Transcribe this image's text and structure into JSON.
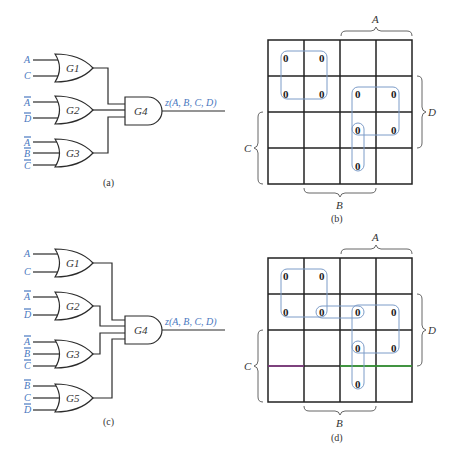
{
  "figure": {
    "panels": [
      {
        "id": "a",
        "caption": "(a)",
        "type": "logic-circuit",
        "gates": [
          {
            "name": "G1",
            "type": "OR",
            "inputs": [
              "A",
              "C"
            ],
            "input_bars": [
              false,
              false
            ]
          },
          {
            "name": "G2",
            "type": "OR",
            "inputs": [
              "A",
              "D"
            ],
            "input_bars": [
              true,
              true
            ]
          },
          {
            "name": "G3",
            "type": "OR",
            "inputs": [
              "A",
              "B",
              "C"
            ],
            "input_bars": [
              true,
              true,
              true
            ]
          },
          {
            "name": "G4",
            "type": "AND",
            "inputs": [
              "G1",
              "G2",
              "G3"
            ]
          }
        ],
        "output_label": "z(A, B, C, D)"
      },
      {
        "id": "b",
        "caption": "(b)",
        "type": "karnaugh-map",
        "var_labels": {
          "top": "A",
          "right": "D",
          "left": "C",
          "bottom": "B"
        },
        "zeros": [
          [
            0,
            0
          ],
          [
            0,
            1
          ],
          [
            1,
            0
          ],
          [
            1,
            1
          ],
          [
            1,
            2
          ],
          [
            1,
            3
          ],
          [
            2,
            2
          ],
          [
            2,
            3
          ],
          [
            3,
            2
          ]
        ],
        "loops": [
          {
            "rows": [
              0,
              1
            ],
            "cols": [
              0,
              1
            ]
          },
          {
            "rows": [
              1,
              2
            ],
            "cols": [
              2,
              3
            ]
          },
          {
            "rows": [
              2,
              3
            ],
            "cols": [
              2,
              2
            ]
          }
        ]
      },
      {
        "id": "c",
        "caption": "(c)",
        "type": "logic-circuit",
        "gates": [
          {
            "name": "G1",
            "type": "OR",
            "inputs": [
              "A",
              "C"
            ],
            "input_bars": [
              false,
              false
            ]
          },
          {
            "name": "G2",
            "type": "OR",
            "inputs": [
              "A",
              "D"
            ],
            "input_bars": [
              true,
              true
            ]
          },
          {
            "name": "G3",
            "type": "OR",
            "inputs": [
              "A",
              "B",
              "C"
            ],
            "input_bars": [
              true,
              true,
              true
            ]
          },
          {
            "name": "G5",
            "type": "OR",
            "inputs": [
              "B",
              "C",
              "D"
            ],
            "input_bars": [
              true,
              false,
              true
            ]
          },
          {
            "name": "G4",
            "type": "AND",
            "inputs": [
              "G1",
              "G2",
              "G3",
              "G5"
            ]
          }
        ],
        "output_label": "z(A, B, C, D)"
      },
      {
        "id": "d",
        "caption": "(d)",
        "type": "karnaugh-map",
        "var_labels": {
          "top": "A",
          "right": "D",
          "left": "C",
          "bottom": "B"
        },
        "zeros": [
          [
            0,
            0
          ],
          [
            0,
            1
          ],
          [
            1,
            0
          ],
          [
            1,
            1
          ],
          [
            1,
            2
          ],
          [
            1,
            3
          ],
          [
            2,
            2
          ],
          [
            2,
            3
          ],
          [
            3,
            2
          ]
        ],
        "loops": [
          {
            "rows": [
              0,
              1
            ],
            "cols": [
              0,
              1
            ]
          },
          {
            "rows": [
              1,
              1
            ],
            "cols": [
              1,
              2
            ]
          },
          {
            "rows": [
              1,
              2
            ],
            "cols": [
              2,
              3
            ]
          },
          {
            "rows": [
              2,
              3
            ],
            "cols": [
              2,
              2
            ]
          }
        ],
        "highlighted_lines": [
          {
            "row_boundary": 3,
            "cols": [
              0,
              0
            ],
            "color": "#8a3a8a"
          },
          {
            "row_boundary": 3,
            "cols": [
              2,
              3
            ],
            "color": "#3aa83a"
          }
        ]
      }
    ]
  },
  "labels": {
    "a_caption": "(a)",
    "b_caption": "(b)",
    "c_caption": "(c)",
    "d_caption": "(d)",
    "g1": "G1",
    "g2": "G2",
    "g3": "G3",
    "g4": "G4",
    "g5": "G5",
    "in_A": "A",
    "in_B": "B",
    "in_C": "C",
    "in_D": "D",
    "output": "z(A, B, C, D)",
    "zero": "0"
  },
  "colors": {
    "input_label": "#4a78c0",
    "loop": "#7c9cc8",
    "highlight_purple": "#8a3a8a",
    "highlight_green": "#3aa83a"
  }
}
